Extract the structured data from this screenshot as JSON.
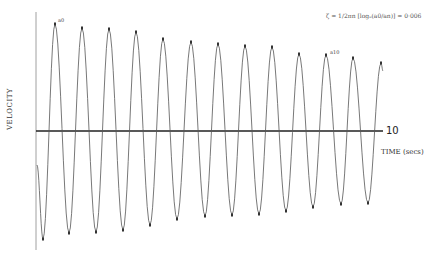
{
  "chart_data": {
    "type": "line",
    "title": "",
    "xlabel": "TIME (secs)",
    "ylabel": "VELOCITY",
    "x_tick_labels": [
      "10"
    ],
    "annotation_formula": "ζ = 1/(2πn) [log_e(a0/an)] = 0·006",
    "peak_labels": [
      "a0",
      "a10"
    ],
    "grid": false,
    "legend": null,
    "x": [
      0,
      1,
      2,
      3,
      4,
      5,
      6,
      7,
      8,
      9,
      10,
      11,
      12
    ],
    "series": [
      {
        "name": "peak amplitude (relative)",
        "values": [
          1.0,
          0.97,
          0.95,
          0.93,
          0.86,
          0.83,
          0.81,
          0.79,
          0.78,
          0.72,
          0.71,
          0.68,
          0.64
        ]
      },
      {
        "name": "trough amplitude (relative)",
        "values": [
          -1.0,
          -0.95,
          -0.94,
          -0.92,
          -0.87,
          -0.82,
          -0.79,
          -0.78,
          -0.77,
          -0.74,
          -0.71,
          -0.68,
          -0.67
        ]
      }
    ],
    "peak_pixels": [
      [
        55,
        24
      ],
      [
        82,
        28
      ],
      [
        109,
        29
      ],
      [
        136,
        32
      ],
      [
        163,
        39
      ],
      [
        191,
        42
      ],
      [
        218,
        44
      ],
      [
        245,
        46
      ],
      [
        272,
        47
      ],
      [
        299,
        54
      ],
      [
        326,
        55
      ],
      [
        353,
        58
      ],
      [
        381,
        63
      ]
    ],
    "trough_pixels": [
      [
        43,
        239
      ],
      [
        69,
        233
      ],
      [
        96,
        232
      ],
      [
        123,
        230
      ],
      [
        150,
        225
      ],
      [
        177,
        219
      ],
      [
        205,
        216
      ],
      [
        232,
        215
      ],
      [
        259,
        214
      ],
      [
        286,
        211
      ],
      [
        313,
        207
      ],
      [
        341,
        204
      ],
      [
        368,
        203
      ]
    ],
    "axis": {
      "x0": 36,
      "y0": 131,
      "x_end": 383,
      "y_top": 12,
      "y_bottom": 250
    },
    "curve_start": [
      37,
      165
    ]
  },
  "labels": {
    "ylabel": "VELOCITY",
    "xlabel": "TIME (secs)",
    "tick": "10",
    "formula": "ζ = 1/2πn [logₑ(a0/an)] = 0·006",
    "a0": "a0",
    "a10": "a10"
  }
}
